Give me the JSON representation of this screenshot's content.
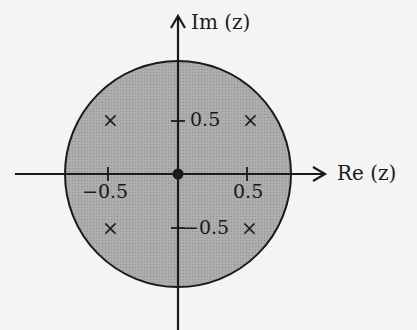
{
  "diagram": {
    "type": "z-plane pole-zero plot",
    "axes": {
      "imag_label": "Im (z)",
      "real_label": "Re (z)"
    },
    "region": {
      "shape": "circle",
      "fill": "#a9a9a9",
      "stroke": "#1a1a1a"
    },
    "ticks": {
      "x_neg": "−0.5",
      "x_pos": "0.5",
      "y_pos": "0.5",
      "y_neg": "−0.5"
    },
    "markers": {
      "origin": "●",
      "poles": [
        "×",
        "×",
        "×",
        "×"
      ],
      "pole_locations": [
        "-0.5+0.5j",
        "0.5+0.5j",
        "-0.5-0.5j",
        "0.5-0.5j"
      ]
    },
    "colors": {
      "background": "#f4f4f2",
      "ink": "#1a1a1a"
    }
  }
}
